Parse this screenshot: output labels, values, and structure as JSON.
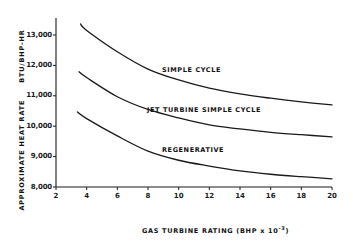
{
  "chart_data": {
    "type": "line",
    "title": "",
    "xlabel": "GAS TURBINE RATING (BHP x 10^-3)",
    "xlabel_main": "GAS TURBINE RATING",
    "xlabel_unit": "(BHP x 10",
    "xlabel_exp": "-3",
    "xlabel_close": ")",
    "ylabel": "APPROXIMATE HEAT RATE BTU/BHP-HR",
    "ylabel_main": "APPROXIMATE HEAT RATE",
    "ylabel_unit": "BTU/BHP-HR",
    "xlim": [
      2,
      20
    ],
    "ylim": [
      8000,
      13500
    ],
    "grid": false,
    "legend": "inline labels",
    "x_ticks": [
      2,
      4,
      6,
      8,
      10,
      12,
      14,
      16,
      18,
      20
    ],
    "x_tick_labels": [
      "2",
      "4",
      "6",
      "8",
      "10",
      "12",
      "14",
      "16",
      "18",
      "20"
    ],
    "y_ticks": [
      8000,
      9000,
      10000,
      11000,
      12000,
      13000
    ],
    "y_tick_labels": [
      "8,000",
      "9,000",
      "10,000",
      "11,000",
      "12,000",
      "13,000"
    ],
    "series": [
      {
        "name": "SIMPLE CYCLE",
        "x": [
          3.6,
          4,
          6,
          8,
          10,
          12,
          14,
          16,
          18,
          20
        ],
        "values": [
          13360,
          13150,
          12450,
          11880,
          11520,
          11250,
          11060,
          10920,
          10800,
          10700
        ]
      },
      {
        "name": "JET TURBINE SIMPLE CYCLE",
        "x": [
          3.5,
          4,
          6,
          8,
          10,
          12,
          14,
          16,
          18,
          20
        ],
        "values": [
          11790,
          11600,
          10970,
          10550,
          10270,
          10040,
          9910,
          9800,
          9720,
          9650
        ]
      },
      {
        "name": "REGENERATIVE",
        "x": [
          3.4,
          4,
          6,
          8,
          10,
          12,
          14,
          16,
          18,
          20
        ],
        "values": [
          10470,
          10250,
          9680,
          9180,
          8880,
          8690,
          8530,
          8420,
          8340,
          8270
        ]
      }
    ],
    "annotations": [
      {
        "text": "SIMPLE CYCLE",
        "x_px": 162,
        "y_px": 66
      },
      {
        "text": "JET TURBINE SIMPLE CYCLE",
        "x_px": 147,
        "y_px": 106
      },
      {
        "text": "REGENERATIVE",
        "x_px": 162,
        "y_px": 146
      }
    ]
  },
  "style": {
    "line_color": "#1a1a1a",
    "axis_color": "#1a1a1a",
    "background": "#ffffff"
  }
}
